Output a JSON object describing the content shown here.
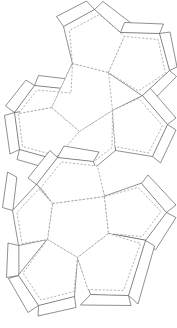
{
  "document": {
    "title": "Dodecahedron Papercraft Net",
    "subject": "regular dodecahedron",
    "kind": "fold-and-glue template",
    "background_color": "#ffffff"
  },
  "legend": {
    "cut_line_label": "cut line",
    "cut_line_style": "solid",
    "cut_line_color": "#54545c",
    "fold_line_label": "fold line",
    "fold_line_style": "dashed",
    "fold_line_color": "#9a9a9a",
    "face_fill_color": "#ffffff"
  },
  "figure": {
    "name": "dodecahedron-net",
    "total_faces": 12,
    "face_shape": "regular pentagon",
    "group_count": 2,
    "faces_per_group": 6,
    "glue_tab_count": 10,
    "width_px": 177,
    "height_px": 328
  },
  "geometry": {
    "upper_group": {
      "name": "upper-half-net",
      "center_face": {
        "name": "upper-center-face",
        "points": "72.5,63.5 108.5,72.5 112.5,110.5 79.5,131.5 51.5,107.5"
      },
      "petal_faces": [
        {
          "name": "upper-petal-face-1",
          "points": "72.5,63.5 63.5,26.5 94.5,9.5 120.5,32.5 108.5,72.5"
        },
        {
          "name": "upper-petal-face-2",
          "points": "108.5,72.5 120.5,32.5 159.5,33.5 169.5,70.5 142.5,95.5"
        },
        {
          "name": "upper-petal-face-3",
          "points": "112.5,110.5 142.5,95.5 167.5,124.5 152.5,156.5 115.5,150.5"
        },
        {
          "name": "upper-petal-face-4",
          "points": "79.5,131.5 112.5,110.5 115.5,150.5 85.5,175.5 55.5,159.5"
        },
        {
          "name": "upper-petal-face-5",
          "points": "51.5,107.5 79.5,131.5 55.5,159.5 19.5,149.5 14.5,112.5"
        }
      ],
      "outer_faces": [
        {
          "name": "upper-outer-face-left",
          "points": "14.5,112.5 19.5,149.5 19.5,149.5 19.5,149.5 14.5,112.5"
        }
      ]
    },
    "lower_group": {
      "name": "lower-half-net",
      "center_face": {
        "name": "lower-center-face",
        "points": "104.5,196.5 108.5,233.5 77.5,257.5 47.5,239.5 52.5,203.5"
      },
      "petal_faces": [
        {
          "name": "lower-petal-face-1",
          "points": "52.5,203.5 104.5,196.5 93.5,161.5 57.5,157.5 36.5,184.5"
        },
        {
          "name": "lower-petal-face-2",
          "points": "104.5,196.5 108.5,233.5 145.5,240.5 166.5,212.5 141.5,183.5"
        },
        {
          "name": "lower-petal-face-3",
          "points": "108.5,233.5 77.5,257.5 90.5,294.5 128.5,295.5 145.5,240.5"
        },
        {
          "name": "lower-petal-face-4",
          "points": "47.5,239.5 77.5,257.5 74.5,296.5 38.5,305.5 18.5,275.5"
        },
        {
          "name": "lower-petal-face-5",
          "points": "52.5,203.5 47.5,239.5 18.5,245.5 12.5,210.5 36.5,184.5"
        }
      ]
    }
  },
  "annotations": {
    "visible_text": [],
    "labels_present": "none"
  }
}
